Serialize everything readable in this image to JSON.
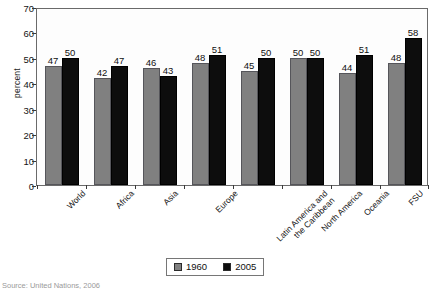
{
  "chart_data": {
    "type": "bar",
    "title": "",
    "xlabel": "",
    "ylabel": "percent",
    "ylim": [
      0,
      70
    ],
    "ytick_step": 10,
    "yticks": [
      0,
      10,
      20,
      30,
      40,
      50,
      60,
      70
    ],
    "grid": false,
    "legend_position": "bottom-center",
    "categories": [
      "World",
      "Africa",
      "Asia",
      "Europe",
      "Latin America and\nthe Caribbean",
      "North America",
      "Oceania",
      "FSU"
    ],
    "series": [
      {
        "name": "1960",
        "color": "#808080",
        "values": [
          47,
          42,
          46,
          48,
          45,
          50,
          44,
          48
        ]
      },
      {
        "name": "2005",
        "color": "#0d0d0d",
        "values": [
          50,
          47,
          43,
          51,
          50,
          50,
          51,
          58
        ]
      }
    ]
  },
  "legend": {
    "items": [
      {
        "label": "1960",
        "color": "#808080"
      },
      {
        "label": "2005",
        "color": "#0d0d0d"
      }
    ]
  },
  "source_note": "Source: United Nations, 2006",
  "colors": {
    "series_1960": "#808080",
    "series_2005": "#0d0d0d",
    "frame": "#6a6a6a",
    "plot_background": "#fdfdfd",
    "text": "#1a1a1a"
  }
}
